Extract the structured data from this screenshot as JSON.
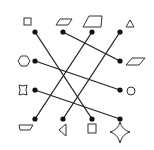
{
  "diagram": {
    "stroke_color": "#222222",
    "background": "#ffffff",
    "dots": [
      {
        "id": "top-1",
        "x": 35,
        "y": 32,
        "shape": "square"
      },
      {
        "id": "top-2",
        "x": 63,
        "y": 32,
        "shape": "parallelogram"
      },
      {
        "id": "top-3",
        "x": 92,
        "y": 32,
        "shape": "trapezoid"
      },
      {
        "id": "top-4",
        "x": 120,
        "y": 32,
        "shape": "triangle"
      },
      {
        "id": "left-1",
        "x": 35,
        "y": 61,
        "shape": "hexagon"
      },
      {
        "id": "left-2",
        "x": 35,
        "y": 90,
        "shape": "concave-square"
      },
      {
        "id": "right-1",
        "x": 120,
        "y": 61,
        "shape": "parallelogram"
      },
      {
        "id": "right-2",
        "x": 120,
        "y": 90,
        "shape": "octagon"
      },
      {
        "id": "bottom-1",
        "x": 35,
        "y": 119,
        "shape": "trapezoid-slanted"
      },
      {
        "id": "bottom-2",
        "x": 63,
        "y": 119,
        "shape": "triangle-left"
      },
      {
        "id": "bottom-3",
        "x": 92,
        "y": 119,
        "shape": "square"
      },
      {
        "id": "bottom-4",
        "x": 120,
        "y": 119,
        "shape": "four-point-star"
      }
    ],
    "connections": [
      {
        "from": "top-1",
        "to": "bottom-3"
      },
      {
        "from": "top-2",
        "to": "right-1"
      },
      {
        "from": "top-3",
        "to": "bottom-1"
      },
      {
        "from": "top-4",
        "to": "bottom-2"
      },
      {
        "from": "left-1",
        "to": "right-2"
      },
      {
        "from": "left-2",
        "to": "bottom-4"
      }
    ]
  }
}
